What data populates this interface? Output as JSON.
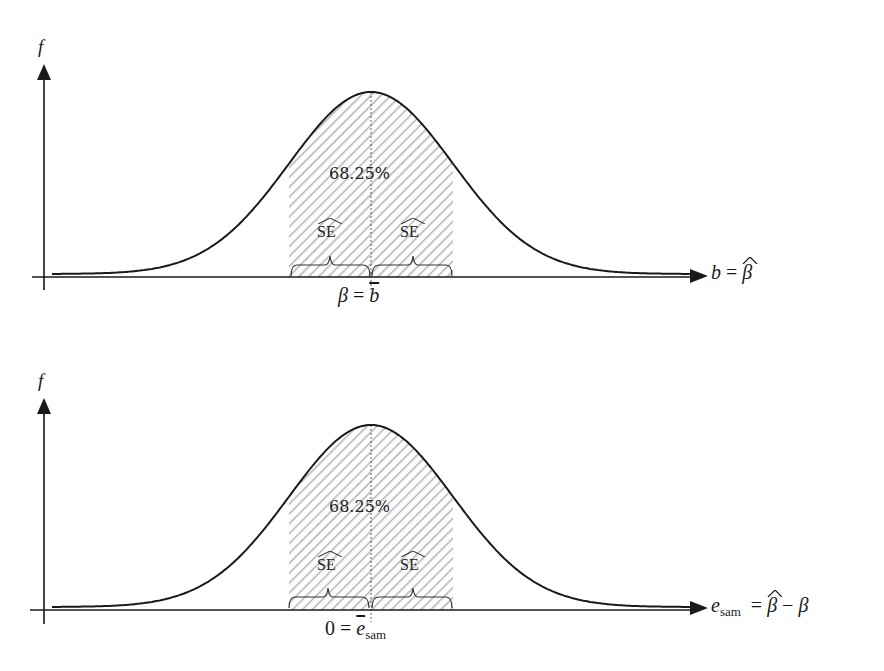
{
  "chart_data": [
    {
      "type": "area",
      "title": "",
      "description": "Normal sampling distribution of estimator b with shaded ±1 SE region",
      "ylabel": "f",
      "xlabel": "b = β̂",
      "center_label": "β = b̄",
      "shaded_region": {
        "from": "-SE",
        "to": "+SE",
        "label": "68.25%"
      },
      "brace_labels": [
        "SE^",
        "SE^"
      ],
      "distribution": "normal",
      "x": [
        -4,
        -3,
        -2,
        -1,
        0,
        1,
        2,
        3,
        4
      ],
      "values": [
        0.0001,
        0.0044,
        0.054,
        0.242,
        0.399,
        0.242,
        0.054,
        0.0044,
        0.0001
      ]
    },
    {
      "type": "area",
      "title": "",
      "description": "Normal sampling distribution of sampling error with shaded ±1 SE region",
      "ylabel": "f",
      "xlabel": "e_sam = β̂ − β",
      "center_label": "0 = ē_sam",
      "shaded_region": {
        "from": "-SE",
        "to": "+SE",
        "label": "68.25%"
      },
      "brace_labels": [
        "SE^",
        "SE^"
      ],
      "distribution": "normal",
      "x": [
        -4,
        -3,
        -2,
        -1,
        0,
        1,
        2,
        3,
        4
      ],
      "values": [
        0.0001,
        0.0044,
        0.054,
        0.242,
        0.399,
        0.242,
        0.054,
        0.0044,
        0.0001
      ]
    }
  ],
  "top": {
    "ylabel": "f",
    "percent": "68.25%",
    "se_left": "SE",
    "se_right": "SE",
    "center_lhs": "β",
    "center_eq": "=",
    "center_rhs": "b",
    "axis_lhs": "b",
    "axis_eq": "=",
    "axis_rhs": "β"
  },
  "bottom": {
    "ylabel": "f",
    "percent": "68.25%",
    "se_left": "SE",
    "se_right": "SE",
    "center_lhs": "0",
    "center_eq": "=",
    "center_rhs": "e",
    "center_rhs_sub": "sam",
    "axis_lhs": "e",
    "axis_lhs_sub": "sam",
    "axis_eq": "=",
    "axis_rhs_a": "β",
    "axis_minus": "−",
    "axis_rhs_b": "β"
  },
  "colors": {
    "ink": "#1a1a1a",
    "hatch": "#b8b8b8",
    "ghost_text": "#e6e6e6"
  }
}
